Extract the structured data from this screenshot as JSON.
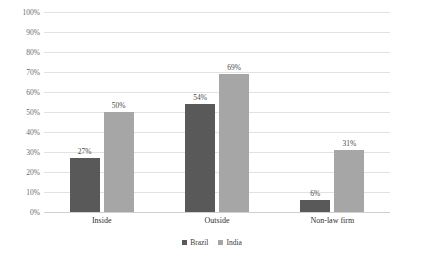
{
  "chart_data": {
    "type": "bar",
    "title": "",
    "subtitle": "",
    "xlabel": "",
    "ylabel": "",
    "categories": [
      "Inside",
      "Outside",
      "Non-law firm"
    ],
    "series": [
      {
        "name": "Brazil",
        "color": "#595959",
        "values": [
          27,
          54,
          6
        ],
        "labels": [
          "27%",
          "50%",
          "6%"
        ]
      },
      {
        "name": "India",
        "color": "#a6a6a6",
        "values": [
          50,
          69,
          31
        ],
        "labels": [
          "50%",
          "69%",
          "31%"
        ]
      }
    ],
    "ylim": [
      0,
      100
    ],
    "y_tick_values": [
      0,
      10,
      20,
      30,
      40,
      50,
      60,
      70,
      80,
      90,
      100
    ],
    "y_tick_labels": [
      "0%",
      "10%",
      "20%",
      "30%",
      "40%",
      "50%",
      "60%",
      "70%",
      "80%",
      "90%",
      "100%"
    ],
    "value_labels": {
      "brazil": [
        "27%",
        "54%",
        "6%"
      ],
      "india": [
        "50%",
        "69%",
        "31%"
      ]
    },
    "grid": {
      "horizontal": true,
      "vertical": false
    },
    "legend": {
      "position": "bottom-center",
      "entries": [
        "Brazil",
        "India"
      ]
    }
  }
}
